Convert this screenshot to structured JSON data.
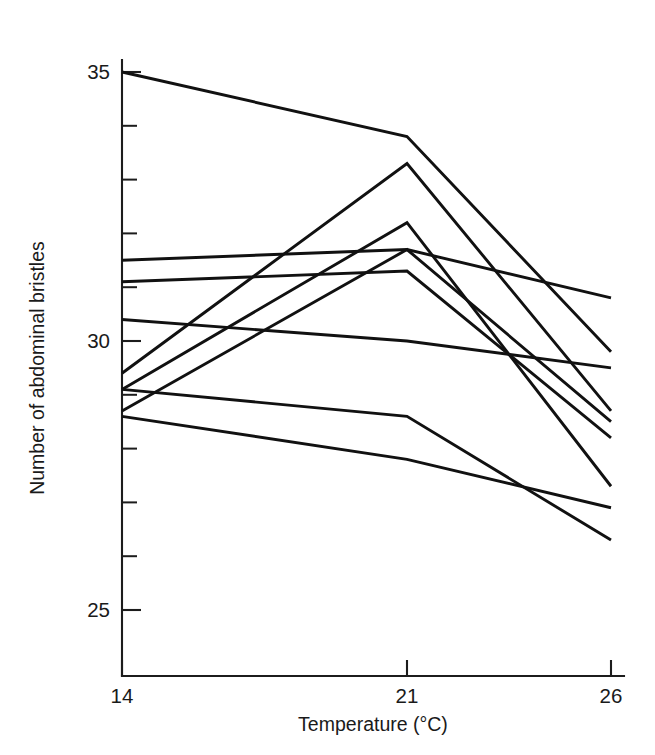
{
  "chart_data": {
    "type": "line",
    "title": "",
    "subtitle": "",
    "xlabel": "Temperature (°C)",
    "ylabel": "Number of abdominal bristles",
    "x": [
      14,
      21,
      26
    ],
    "xtick_labels": [
      "14",
      "21",
      "26"
    ],
    "ytick_labels": [
      "25",
      "30",
      "35"
    ],
    "yticks_major": [
      25,
      30,
      35
    ],
    "yticks_minor": [
      24.5,
      25.5,
      26,
      26.5,
      27,
      27.5,
      28,
      28.5,
      29,
      29.5,
      30.5,
      31,
      31.5,
      32,
      32.5,
      33,
      33.5,
      34,
      34.5
    ],
    "xlim": [
      13.2,
      26.6
    ],
    "ylim": [
      24.2,
      35.45
    ],
    "grid": false,
    "legend": false,
    "legend_position": "none",
    "annotations": [],
    "series": [
      {
        "name": "line-1",
        "values": [
          35.0,
          33.8,
          29.8
        ]
      },
      {
        "name": "line-2",
        "values": [
          29.4,
          33.3,
          28.7
        ]
      },
      {
        "name": "line-3",
        "values": [
          29.1,
          32.2,
          27.3
        ]
      },
      {
        "name": "line-4",
        "values": [
          31.5,
          31.7,
          30.8
        ]
      },
      {
        "name": "line-5",
        "values": [
          28.7,
          31.7,
          28.5
        ]
      },
      {
        "name": "line-6",
        "values": [
          31.1,
          31.3,
          28.2
        ]
      },
      {
        "name": "line-7",
        "values": [
          30.4,
          30.0,
          29.5
        ]
      },
      {
        "name": "line-8",
        "values": [
          29.1,
          28.6,
          26.3
        ]
      },
      {
        "name": "line-9",
        "values": [
          28.6,
          27.8,
          26.9
        ]
      }
    ]
  },
  "axes": {
    "x_axis_label": "Temperature (°C)",
    "y_axis_label": "Number of abdominal bristles",
    "x_ticks": [
      {
        "label": "14",
        "value": 14
      },
      {
        "label": "21",
        "value": 21
      },
      {
        "label": "26",
        "value": 26
      }
    ],
    "y_ticks": [
      {
        "label": "35",
        "value": 35
      },
      {
        "label": "30",
        "value": 30
      },
      {
        "label": "25",
        "value": 25
      }
    ]
  },
  "colors": {
    "line": "#111111",
    "axis": "#1c1c1c",
    "text": "#1a1a1a",
    "background": "#ffffff"
  }
}
